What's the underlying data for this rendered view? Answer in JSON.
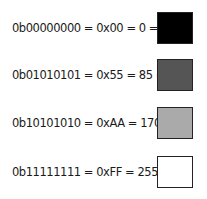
{
  "rows": [
    {
      "label": "0b00000000 = 0x00 = 0 =",
      "binary": "0b00000000",
      "hex": "0x00",
      "decimal": 0,
      "color": "#000000"
    },
    {
      "label": "0b01010101 = 0x55 = 85 =",
      "binary": "0b01010101",
      "hex": "0x55",
      "decimal": 85,
      "color": "#555555"
    },
    {
      "label": "0b10101010 = 0xAA = 170 =",
      "binary": "0b10101010",
      "hex": "0xAA",
      "decimal": 170,
      "color": "#aaaaaa"
    },
    {
      "label": "0b11111111 = 0xFF = 255 =",
      "binary": "0b11111111",
      "hex": "0xFF",
      "decimal": 255,
      "color": "#ffffff"
    }
  ]
}
